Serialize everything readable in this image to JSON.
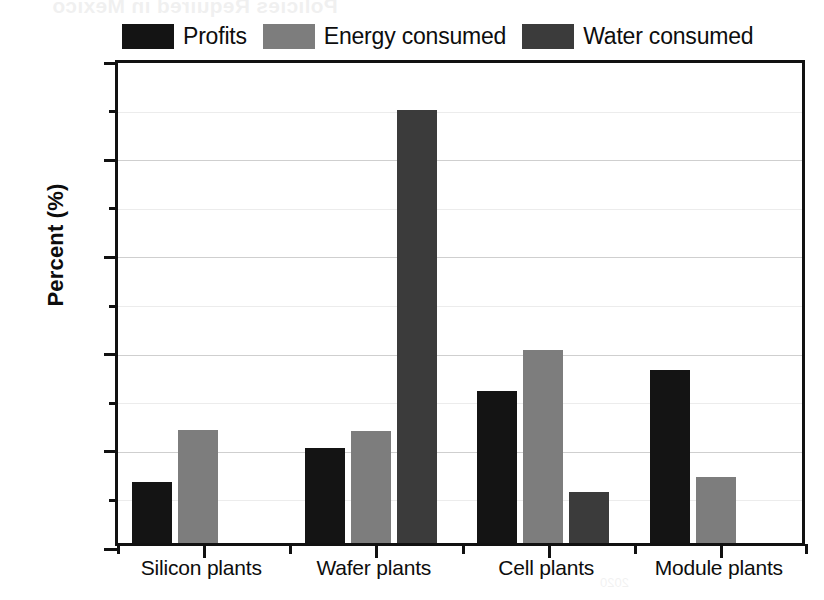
{
  "chart_data": {
    "type": "bar",
    "title": "",
    "xlabel": "",
    "ylabel": "Percent (%)",
    "ylim": [
      0,
      100
    ],
    "ytick_labels": [
      "0",
      "20",
      "40",
      "60",
      "80",
      "100"
    ],
    "ytick_values": [
      0,
      20,
      40,
      60,
      80,
      100
    ],
    "yminor_values": [
      10,
      30,
      50,
      70,
      90
    ],
    "grid": true,
    "legend_position": "top",
    "categories": [
      "Silicon plants",
      "Wafer plants",
      "Cell plants",
      "Module plants"
    ],
    "series": [
      {
        "name": "Profits",
        "color": "#141414",
        "values": [
          12.5,
          19.5,
          31.3,
          35.5
        ]
      },
      {
        "name": "Energy consumed",
        "color": "#7d7d7d",
        "values": [
          23.3,
          23.0,
          39.7,
          13.5
        ]
      },
      {
        "name": "Water consumed",
        "color": "#3b3b3b",
        "values": [
          null,
          89.0,
          10.4,
          null
        ]
      }
    ]
  },
  "legend": {
    "items": [
      {
        "label": "Profits",
        "swatch": "#141414"
      },
      {
        "label": "Energy consumed",
        "swatch": "#7d7d7d"
      },
      {
        "label": "Water consumed",
        "swatch": "#3b3b3b"
      }
    ]
  },
  "axes": {
    "y_title": "Percent (%)",
    "y_labels": [
      "100",
      "80",
      "60",
      "40",
      "20",
      "0"
    ],
    "x_labels": [
      "Silicon plants",
      "Wafer plants",
      "Cell plants",
      "Module plants"
    ]
  },
  "artifacts": {
    "bleed_text_top": "Policies Required in Mexico",
    "bleed_text_mid": "renewable energy investment",
    "bleed_text_bottom": "2020"
  }
}
